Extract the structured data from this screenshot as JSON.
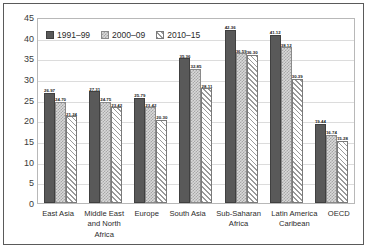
{
  "chart_data": {
    "type": "bar",
    "title": "",
    "xlabel": "",
    "ylabel": "",
    "ylim": [
      0,
      45
    ],
    "yticks": [
      45,
      40,
      35,
      30,
      25,
      20,
      15,
      10,
      5,
      0
    ],
    "grid": true,
    "legend_position": "top-left",
    "categories": [
      "East Asia",
      "Middle East and North Africa",
      "Europe",
      "South Asia",
      "Sub-Saharan Africa",
      "Latin America Caribean",
      "OECD"
    ],
    "series": [
      {
        "name": "1991–99",
        "pattern": "solid-dark",
        "values": [
          26.97,
          27.31,
          25.79,
          35.36,
          42.36,
          41.12,
          19.44
        ]
      },
      {
        "name": "2000–09",
        "pattern": "checkered-light",
        "values": [
          24.7,
          24.75,
          23.42,
          32.85,
          36.59,
          38.12,
          16.74
        ]
      },
      {
        "name": "2010–15",
        "pattern": "diagonal-hatch",
        "values": [
          21.24,
          23.42,
          20.3,
          28.11,
          36.3,
          30.39,
          15.28
        ]
      }
    ]
  },
  "labels": {
    "east_asia": "East Asia",
    "middle_east_l1": "Middle East",
    "middle_east_l2": "and North",
    "middle_east_l3": "Africa",
    "europe": "Europe",
    "south_asia": "South Asia",
    "ssa_l1": "Sub-Saharan",
    "ssa_l2": "Africa",
    "lac_l1": "Latin America",
    "lac_l2": "Caribean",
    "oecd": "OECD"
  }
}
